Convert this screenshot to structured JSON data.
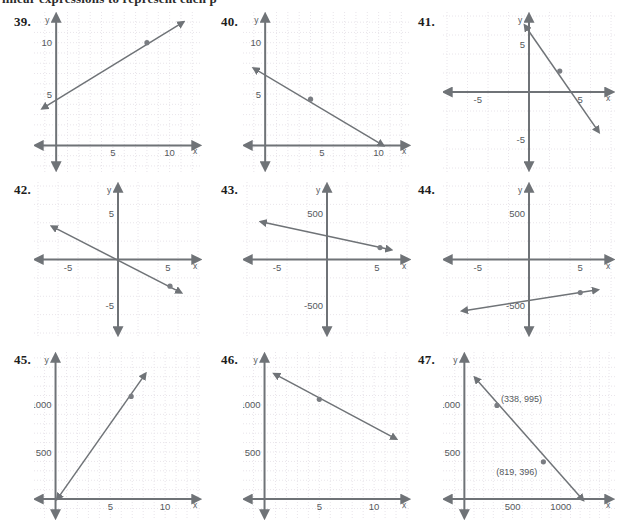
{
  "page": {
    "top_cut_text": "linear expressions to represent each p",
    "background": "#ffffff",
    "ink": "#6f7377",
    "label_color": "#55595d",
    "grid_color": "#e8e4ea",
    "point_color": "#7a7d82"
  },
  "problems": [
    {
      "number": "39.",
      "axis": {
        "x_label": "x",
        "y_label": "y",
        "x_ticks": [
          "5",
          "10"
        ],
        "y_ticks": [
          "5",
          "10"
        ]
      },
      "chart_data": {
        "type": "line",
        "title": "39",
        "xlabel": "x",
        "ylabel": "y",
        "xlim": [
          -1.6,
          12.5
        ],
        "ylim": [
          -2.2,
          12.6
        ],
        "x_ticks": [
          5,
          10
        ],
        "y_ticks": [
          5,
          10
        ],
        "grid": true,
        "quadrants": "first",
        "series": [
          {
            "name": "line",
            "x": [
              -1.2,
              11.2
            ],
            "y": [
              3.6,
              12.0
            ],
            "arrows": "both"
          }
        ],
        "points": [
          {
            "x": 8,
            "y": 10
          }
        ],
        "intercept_y": 4.5,
        "slope": 0.68
      }
    },
    {
      "number": "40.",
      "axis": {
        "x_label": "x",
        "y_label": "y",
        "x_ticks": [
          "5",
          "10"
        ],
        "y_ticks": [
          "5",
          "10"
        ]
      },
      "chart_data": {
        "type": "line",
        "title": "40",
        "xlabel": "x",
        "ylabel": "y",
        "xlim": [
          -1.6,
          12.5
        ],
        "ylim": [
          -2.2,
          12.6
        ],
        "x_ticks": [
          5,
          10
        ],
        "y_ticks": [
          5,
          10
        ],
        "grid": true,
        "quadrants": "first",
        "series": [
          {
            "name": "line",
            "x": [
              -1.0,
              10.4
            ],
            "y": [
              7.5,
              0.0
            ],
            "arrows": "both"
          }
        ],
        "points": [
          {
            "x": 4,
            "y": 4.5
          }
        ],
        "intercept_y": 6.8,
        "slope": -0.66
      }
    },
    {
      "number": "41.",
      "axis": {
        "x_label": "x",
        "y_label": "y",
        "x_ticks": [
          "-5",
          "5"
        ],
        "y_ticks": [
          "5",
          "-5"
        ]
      },
      "chart_data": {
        "type": "line",
        "title": "41",
        "xlabel": "x",
        "ylabel": "y",
        "xlim": [
          -8,
          8
        ],
        "ylim": [
          -8,
          8
        ],
        "x_ticks": [
          -5,
          5
        ],
        "y_ticks": [
          -5,
          5
        ],
        "grid": true,
        "quadrants": "four",
        "series": [
          {
            "name": "line",
            "x": [
              -0.4,
              6.8
            ],
            "y": [
              7.0,
              -4.2
            ],
            "arrows": "both"
          }
        ],
        "points": [
          {
            "x": 3,
            "y": 2.2
          }
        ],
        "intercept_y": 6.4,
        "slope": -1.55
      }
    },
    {
      "number": "42.",
      "axis": {
        "x_label": "x",
        "y_label": "y",
        "x_ticks": [
          "-5",
          "5"
        ],
        "y_ticks": [
          "5",
          "-5"
        ]
      },
      "chart_data": {
        "type": "line",
        "title": "42",
        "xlabel": "x",
        "ylabel": "y",
        "xlim": [
          -8,
          8
        ],
        "ylim": [
          -8,
          8
        ],
        "x_ticks": [
          -5,
          5
        ],
        "y_ticks": [
          -5,
          5
        ],
        "grid": true,
        "quadrants": "four",
        "series": [
          {
            "name": "line",
            "x": [
              -6.6,
              6.3
            ],
            "y": [
              3.6,
              -3.6
            ],
            "arrows": "both"
          }
        ],
        "points": [
          {
            "x": 5.2,
            "y": -2.9
          }
        ],
        "intercept_y": 0,
        "slope": -0.56
      }
    },
    {
      "number": "43.",
      "axis": {
        "x_label": "x",
        "y_label": "y",
        "x_ticks": [
          "-5",
          "5"
        ],
        "y_ticks": [
          "500",
          "-500"
        ]
      },
      "chart_data": {
        "type": "line",
        "title": "43",
        "xlabel": "x",
        "ylabel": "y",
        "xlim": [
          -8,
          8
        ],
        "ylim": [
          -800,
          800
        ],
        "x_ticks": [
          -5,
          5
        ],
        "y_ticks": [
          -500,
          500
        ],
        "grid": true,
        "quadrants": "four",
        "series": [
          {
            "name": "line",
            "x": [
              -6.6,
              6.4
            ],
            "y": [
              410,
              105
            ],
            "arrows": "both"
          }
        ],
        "points": [
          {
            "x": 5.3,
            "y": 130
          }
        ],
        "intercept_y": 255,
        "slope": -23.5
      }
    },
    {
      "number": "44.",
      "axis": {
        "x_label": "x",
        "y_label": "y",
        "x_ticks": [
          "-5",
          "5"
        ],
        "y_ticks": [
          "500",
          "-500"
        ]
      },
      "chart_data": {
        "type": "line",
        "title": "44",
        "xlabel": "x",
        "ylabel": "y",
        "xlim": [
          -8,
          8
        ],
        "ylim": [
          -800,
          800
        ],
        "x_ticks": [
          -5,
          5
        ],
        "y_ticks": [
          -500,
          500
        ],
        "grid": true,
        "quadrants": "four",
        "series": [
          {
            "name": "line",
            "x": [
              -6.5,
              6.7
            ],
            "y": [
              -560,
              -330
            ],
            "arrows": "both"
          }
        ],
        "points": [
          {
            "x": 5.0,
            "y": -360
          }
        ],
        "intercept_y": -450,
        "slope": 17.5
      }
    },
    {
      "number": "45.",
      "axis": {
        "x_label": "x",
        "y_label": "y",
        "x_ticks": [
          "5",
          "10"
        ],
        "y_ticks": [
          "500",
          "1000"
        ]
      },
      "chart_data": {
        "type": "line",
        "title": "45",
        "xlabel": "x",
        "ylabel": "y",
        "xlim": [
          -1.6,
          13.0
        ],
        "ylim": [
          -180,
          1520
        ],
        "x_ticks": [
          5,
          10
        ],
        "y_ticks": [
          500,
          1000
        ],
        "grid": true,
        "quadrants": "first",
        "series": [
          {
            "name": "line",
            "x": [
              0.15,
              8.2
            ],
            "y": [
              0,
              1330
            ],
            "arrows": "both"
          }
        ],
        "points": [
          {
            "x": 6.9,
            "y": 1090
          }
        ],
        "intercept_y": 0,
        "slope": 165
      }
    },
    {
      "number": "46.",
      "axis": {
        "x_label": "x",
        "y_label": "y",
        "x_ticks": [
          "5",
          "10"
        ],
        "y_ticks": [
          "500",
          "1000"
        ]
      },
      "chart_data": {
        "type": "line",
        "title": "46",
        "xlabel": "x",
        "ylabel": "y",
        "xlim": [
          -1.6,
          13.0
        ],
        "ylim": [
          -180,
          1520
        ],
        "x_ticks": [
          5,
          10
        ],
        "y_ticks": [
          500,
          1000
        ],
        "grid": true,
        "quadrants": "first",
        "series": [
          {
            "name": "line",
            "x": [
              0.9,
              12.0
            ],
            "y": [
              1330,
              640
            ],
            "arrows": "both"
          }
        ],
        "points": [
          {
            "x": 5.0,
            "y": 1060
          }
        ],
        "intercept_y": 1390,
        "slope": -62
      }
    },
    {
      "number": "47.",
      "axis": {
        "x_label": "x",
        "y_label": "y",
        "x_ticks": [
          "500",
          "1000"
        ],
        "y_ticks": [
          "500",
          "1000"
        ]
      },
      "annotations": [
        {
          "text": "(338, 995)",
          "x": 338,
          "y": 995
        },
        {
          "text": "(819, 396)",
          "x": 819,
          "y": 396
        }
      ],
      "chart_data": {
        "type": "line",
        "title": "47",
        "xlabel": "x",
        "ylabel": "y",
        "xlim": [
          -180,
          1520
        ],
        "ylim": [
          -180,
          1520
        ],
        "x_ticks": [
          500,
          1000
        ],
        "y_ticks": [
          500,
          1000
        ],
        "grid": true,
        "quadrants": "first",
        "series": [
          {
            "name": "line",
            "x": [
              110,
              1230
            ],
            "y": [
              1290,
              -10
            ],
            "arrows": "both"
          }
        ],
        "points": [
          {
            "x": 338,
            "y": 995
          },
          {
            "x": 819,
            "y": 396
          }
        ],
        "labels": [
          "(338, 995)",
          "(819, 396)"
        ],
        "intercept_y": 1415,
        "slope": -1.245
      }
    }
  ]
}
